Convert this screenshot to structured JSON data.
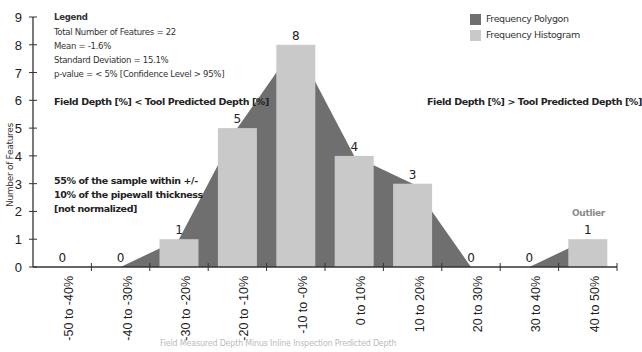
{
  "chart_data": {
    "type": "bar",
    "title": "",
    "xlabel": "Field Measured Depth Minus Inline Inspection Predicted Depth",
    "ylabel": "Number of Features",
    "ylim": [
      0,
      9
    ],
    "yticks": [
      0,
      1,
      2,
      3,
      4,
      5,
      6,
      7,
      8,
      9
    ],
    "grid": false,
    "categories": [
      "-50 to -40%",
      "-40 to -30%",
      "-30 to -20%",
      "-20 to -10%",
      "-10 to -0%",
      "0 to 10%",
      "10 to 20%",
      "20 to 30%",
      "30 to 40%",
      "40 to 50%"
    ],
    "series": [
      {
        "name": "Frequency Histogram",
        "type": "bar",
        "color": "#c9c9c9",
        "values": [
          0,
          0,
          1,
          5,
          8,
          4,
          3,
          0,
          0,
          1
        ]
      },
      {
        "name": "Frequency Polygon",
        "type": "area",
        "color": "#6f6f6f",
        "values": [
          0,
          0,
          1,
          5,
          8,
          4,
          3,
          0,
          0,
          1
        ]
      }
    ],
    "data_labels": [
      "0",
      "0",
      "1",
      "5",
      "8",
      "4",
      "3",
      "0",
      "0",
      "1"
    ],
    "legend_position": "top-right",
    "annotations": {
      "outlier_label": "Outlier",
      "outlier_category": "40 to 50%"
    }
  },
  "legend": {
    "title": "Legend",
    "lines": [
      "Total Number of Features = 22",
      "Mean = -1.6%",
      "Standard Deviation = 15.1%",
      "p-value = < 5% [Confidence Level > 95%]"
    ]
  },
  "key": {
    "items": [
      {
        "label": "Frequency Polygon",
        "color": "#6f6f6f"
      },
      {
        "label": "Frequency Histogram",
        "color": "#c9c9c9"
      }
    ]
  },
  "notes": {
    "left_region": "Field Depth [%] < Tool Predicted Depth [%]",
    "right_region": "Field Depth [%] > Tool Predicted Depth [%]",
    "sample_line1": "55% of the sample within +/-",
    "sample_line2": "10% of the pipewall thickness",
    "sample_line3": "[not normalized]"
  },
  "colors": {
    "axis": "#333333",
    "outlier_text": "#8a8a8a"
  }
}
